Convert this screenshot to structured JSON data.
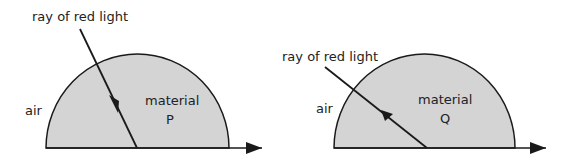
{
  "diagrams": [
    {
      "ray_label": "ray of red light",
      "outside_label": "air",
      "material_label": "material",
      "material_letter": "P"
    },
    {
      "ray_label": "ray of red light",
      "outside_label": "air",
      "material_label": "material",
      "material_letter": "Q"
    }
  ],
  "colors": {
    "material_fill": "#d4d4d4",
    "stroke": "#1a1a1a"
  }
}
